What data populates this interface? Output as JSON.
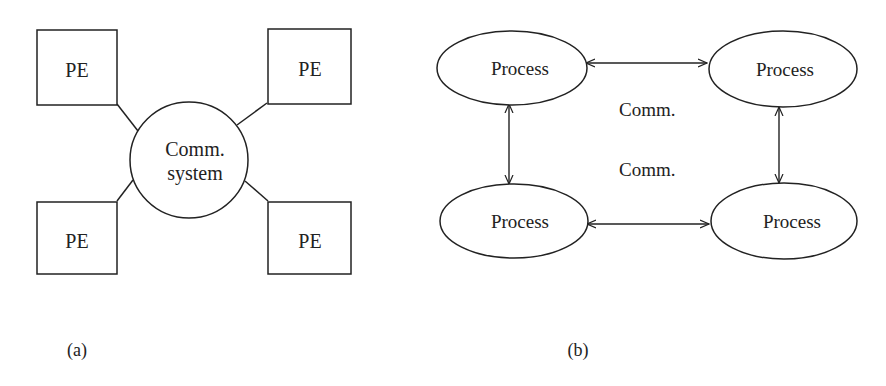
{
  "figure_a": {
    "caption": "(a)",
    "center_node": {
      "line1": "Comm.",
      "line2": "system"
    },
    "pe_nodes": [
      {
        "label": "PE"
      },
      {
        "label": "PE"
      },
      {
        "label": "PE"
      },
      {
        "label": "PE"
      }
    ]
  },
  "figure_b": {
    "caption": "(b)",
    "processes": [
      {
        "label": "Process"
      },
      {
        "label": "Process"
      },
      {
        "label": "Process"
      },
      {
        "label": "Process"
      }
    ],
    "comm_labels": [
      {
        "label": "Comm."
      },
      {
        "label": "Comm."
      }
    ]
  },
  "colors": {
    "stroke": "#222222",
    "background": "#ffffff"
  }
}
